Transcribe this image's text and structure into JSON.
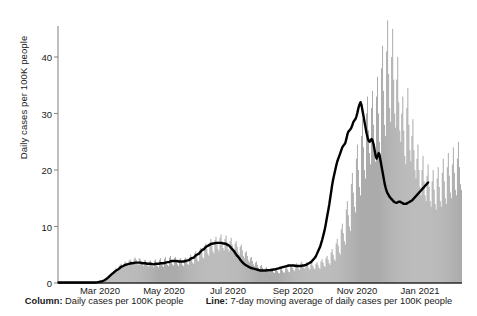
{
  "chart_data": {
    "type": "bar",
    "title": "",
    "subtitle": "",
    "xlabel": "",
    "ylabel": "Daily cases per 100K people",
    "ylim": [
      0,
      48
    ],
    "yticks": [
      0,
      10,
      20,
      30,
      40
    ],
    "ytick_labels": [
      "0",
      "10",
      "20",
      "30",
      "40"
    ],
    "xtick_labels": [
      "Mar 2020",
      "May 2020",
      "Jul 2020",
      "Sep 2020",
      "Nov 2020",
      "Jan 2021"
    ],
    "xtick_positions": [
      100,
      164,
      228,
      293,
      357,
      420
    ],
    "grid": false,
    "legend_position": "below",
    "series": [
      {
        "name": "Column: Daily cases per 100K people",
        "type": "bar",
        "color": "#9a9a9a",
        "values": [
          0.1,
          0.1,
          0.1,
          0.1,
          0.1,
          0.1,
          0.1,
          0.1,
          0.1,
          0.1,
          0.1,
          0.1,
          0.1,
          0.1,
          0.1,
          0.1,
          0.1,
          0.1,
          0.1,
          0.1,
          0.1,
          0.1,
          0.1,
          0.1,
          0.1,
          0.1,
          0.1,
          0.1,
          0.1,
          0.1,
          0.1,
          0.1,
          0.1,
          0.1,
          0.1,
          0.1,
          0.1,
          0.1,
          0.1,
          0.2,
          0.2,
          0.2,
          0.3,
          0.3,
          0.4,
          0.5,
          0.6,
          0.8,
          0.9,
          1.0,
          1.2,
          1.4,
          1.5,
          1.7,
          1.8,
          2.0,
          2.2,
          2.6,
          2.3,
          2.1,
          2.9,
          3.2,
          3.4,
          3.0,
          2.7,
          3.4,
          3.8,
          3.6,
          3.2,
          3.0,
          4.0,
          4.2,
          3.9,
          3.3,
          3.1,
          4.3,
          4.5,
          4.1,
          3.4,
          3.2,
          4.4,
          4.2,
          3.8,
          3.3,
          3.0,
          4.0,
          4.1,
          3.6,
          3.1,
          2.9,
          3.8,
          4.0,
          3.5,
          3.0,
          2.8,
          3.9,
          4.2,
          3.4,
          3.0,
          2.8,
          4.1,
          4.4,
          3.6,
          3.1,
          2.9,
          4.3,
          4.6,
          3.8,
          3.2,
          3.0,
          4.5,
          4.8,
          4.0,
          3.3,
          3.1,
          4.4,
          4.6,
          3.9,
          3.3,
          3.0,
          4.2,
          4.4,
          3.8,
          3.2,
          3.0,
          4.3,
          4.5,
          3.9,
          3.4,
          3.2,
          4.6,
          5.0,
          4.2,
          3.6,
          3.4,
          5.2,
          5.6,
          4.8,
          4.0,
          3.8,
          5.8,
          6.2,
          5.4,
          4.6,
          4.3,
          6.6,
          7.0,
          6.0,
          5.2,
          4.8,
          7.2,
          7.8,
          6.6,
          5.6,
          5.2,
          7.6,
          8.2,
          7.0,
          6.0,
          5.6,
          8.0,
          8.6,
          7.4,
          6.2,
          5.8,
          7.8,
          8.4,
          7.2,
          6.0,
          5.6,
          7.4,
          8.0,
          6.8,
          5.8,
          5.4,
          7.0,
          7.4,
          6.4,
          5.4,
          5.0,
          6.4,
          6.8,
          5.8,
          4.8,
          4.4,
          5.4,
          5.6,
          4.8,
          4.0,
          3.7,
          4.4,
          4.6,
          3.9,
          3.3,
          3.0,
          3.6,
          3.8,
          3.2,
          2.7,
          2.5,
          3.0,
          3.2,
          2.7,
          2.3,
          2.1,
          2.6,
          2.8,
          2.4,
          2.0,
          1.9,
          2.4,
          2.6,
          2.2,
          1.9,
          1.8,
          2.3,
          2.5,
          2.1,
          1.8,
          1.7,
          2.4,
          2.6,
          2.2,
          1.9,
          1.8,
          2.6,
          2.8,
          2.4,
          2.0,
          1.9,
          2.9,
          3.2,
          2.7,
          2.3,
          2.1,
          3.2,
          3.5,
          3.0,
          2.5,
          2.3,
          3.5,
          3.8,
          3.2,
          2.7,
          2.5,
          3.4,
          3.7,
          3.1,
          2.6,
          2.4,
          3.3,
          3.6,
          3.0,
          2.6,
          2.4,
          3.4,
          3.7,
          3.2,
          2.7,
          2.5,
          3.8,
          4.2,
          3.6,
          3.0,
          2.8,
          4.4,
          4.8,
          4.1,
          3.5,
          3.2,
          5.4,
          6.0,
          5.0,
          4.2,
          3.9,
          7.0,
          7.8,
          6.6,
          5.4,
          5.0,
          9.5,
          10.5,
          8.8,
          7.4,
          6.8,
          13.0,
          14.5,
          12.0,
          10.0,
          9.2,
          17.5,
          19.5,
          16.0,
          13.5,
          12.5,
          22.0,
          24.5,
          20.0,
          17.0,
          15.5,
          26.0,
          29.0,
          24.0,
          20.0,
          18.5,
          30.0,
          33.0,
          27.0,
          23.0,
          21.0,
          31.0,
          34.0,
          28.0,
          23.5,
          21.5,
          33.0,
          36.5,
          30.0,
          25.0,
          23.0,
          38.0,
          42.0,
          34.0,
          28.0,
          26.0,
          41.0,
          46.5,
          37.0,
          31.0,
          28.5,
          40.0,
          45.0,
          36.0,
          30.0,
          27.5,
          36.0,
          40.0,
          32.0,
          27.0,
          25.0,
          30.0,
          33.0,
          27.0,
          22.5,
          21.0,
          31.0,
          34.5,
          28.0,
          23.5,
          21.5,
          26.0,
          29.0,
          23.5,
          20.0,
          18.5,
          22.0,
          24.5,
          20.0,
          17.0,
          15.5,
          20.0,
          22.5,
          18.0,
          15.5,
          14.5,
          19.0,
          21.0,
          17.0,
          14.5,
          13.5,
          18.0,
          20.0,
          16.5,
          14.0,
          13.0,
          18.5,
          20.5,
          17.0,
          14.5,
          13.5,
          19.5,
          22.0,
          18.0,
          15.0,
          14.0,
          20.5,
          23.0,
          19.0,
          16.0,
          15.0,
          21.0,
          24.0,
          19.5,
          16.5,
          15.5,
          22.0,
          25.0,
          20.5,
          17.5,
          16.5
        ]
      },
      {
        "name": "Line: 7-day moving average of daily cases per 100K people",
        "type": "line",
        "color": "#000000",
        "values": [
          0.1,
          0.1,
          0.1,
          0.1,
          0.1,
          0.1,
          0.1,
          0.1,
          0.1,
          0.1,
          0.1,
          0.1,
          0.1,
          0.1,
          0.1,
          0.1,
          0.1,
          0.1,
          0.1,
          0.1,
          0.1,
          0.1,
          0.1,
          0.1,
          0.1,
          0.1,
          0.1,
          0.1,
          0.1,
          0.1,
          0.1,
          0.1,
          0.1,
          0.1,
          0.1,
          0.1,
          0.1,
          0.1,
          0.12,
          0.15,
          0.18,
          0.22,
          0.26,
          0.3,
          0.36,
          0.45,
          0.55,
          0.68,
          0.8,
          0.95,
          1.1,
          1.3,
          1.45,
          1.6,
          1.75,
          1.9,
          2.05,
          2.2,
          2.3,
          2.4,
          2.55,
          2.7,
          2.85,
          2.95,
          3.0,
          3.1,
          3.2,
          3.25,
          3.3,
          3.35,
          3.4,
          3.45,
          3.5,
          3.5,
          3.5,
          3.55,
          3.6,
          3.6,
          3.6,
          3.6,
          3.6,
          3.6,
          3.55,
          3.5,
          3.5,
          3.5,
          3.5,
          3.45,
          3.4,
          3.4,
          3.4,
          3.4,
          3.4,
          3.35,
          3.3,
          3.35,
          3.4,
          3.4,
          3.4,
          3.4,
          3.45,
          3.5,
          3.5,
          3.5,
          3.5,
          3.55,
          3.6,
          3.65,
          3.7,
          3.7,
          3.75,
          3.85,
          3.9,
          3.9,
          3.9,
          3.9,
          3.9,
          3.9,
          3.85,
          3.8,
          3.8,
          3.8,
          3.8,
          3.8,
          3.8,
          3.85,
          3.9,
          3.95,
          4.0,
          4.05,
          4.15,
          4.3,
          4.4,
          4.45,
          4.5,
          4.7,
          4.9,
          5.0,
          5.1,
          5.2,
          5.4,
          5.6,
          5.8,
          5.9,
          6.0,
          6.2,
          6.4,
          6.5,
          6.6,
          6.7,
          6.8,
          6.9,
          6.95,
          7.0,
          7.0,
          7.05,
          7.1,
          7.1,
          7.1,
          7.1,
          7.1,
          7.1,
          7.05,
          7.0,
          7.0,
          6.95,
          6.9,
          6.8,
          6.7,
          6.6,
          6.4,
          6.2,
          6.0,
          5.8,
          5.6,
          5.3,
          5.0,
          4.8,
          4.6,
          4.4,
          4.1,
          3.9,
          3.7,
          3.5,
          3.35,
          3.2,
          3.1,
          3.0,
          2.9,
          2.8,
          2.7,
          2.65,
          2.6,
          2.55,
          2.5,
          2.45,
          2.4,
          2.35,
          2.3,
          2.25,
          2.2,
          2.2,
          2.2,
          2.2,
          2.2,
          2.2,
          2.25,
          2.25,
          2.25,
          2.25,
          2.3,
          2.3,
          2.35,
          2.4,
          2.4,
          2.45,
          2.5,
          2.55,
          2.6,
          2.65,
          2.7,
          2.75,
          2.8,
          2.85,
          2.9,
          2.95,
          3.0,
          3.05,
          3.1,
          3.1,
          3.1,
          3.1,
          3.1,
          3.1,
          3.05,
          3.05,
          3.0,
          3.0,
          3.0,
          3.0,
          3.0,
          3.05,
          3.1,
          3.1,
          3.15,
          3.2,
          3.3,
          3.4,
          3.5,
          3.6,
          3.7,
          3.9,
          4.1,
          4.3,
          4.5,
          4.8,
          5.2,
          5.6,
          6.0,
          6.4,
          7.0,
          7.6,
          8.3,
          9.0,
          9.8,
          10.8,
          11.8,
          12.8,
          13.8,
          15.0,
          16.2,
          17.4,
          18.4,
          19.2,
          20.0,
          20.8,
          21.5,
          22.0,
          22.5,
          23.0,
          23.5,
          24.0,
          24.3,
          24.5,
          24.8,
          25.5,
          26.3,
          26.8,
          27.0,
          27.2,
          27.5,
          28.0,
          28.5,
          28.8,
          29.0,
          29.5,
          30.2,
          31.0,
          31.6,
          32.0,
          31.5,
          30.5,
          29.5,
          28.5,
          27.5,
          26.5,
          25.8,
          25.2,
          25.0,
          25.2,
          25.5,
          25.2,
          24.5,
          23.5,
          22.5,
          22.0,
          22.5,
          23.0,
          22.5,
          21.5,
          20.5,
          19.5,
          18.5,
          17.5,
          16.8,
          16.2,
          15.8,
          15.5,
          15.2,
          15.0,
          14.8,
          14.6,
          14.4,
          14.3,
          14.2,
          14.2,
          14.3,
          14.4,
          14.4,
          14.3,
          14.2,
          14.1,
          14.0,
          14.0,
          14.0,
          14.1,
          14.2,
          14.3,
          14.4,
          14.5,
          14.6,
          14.8,
          15.0,
          15.2,
          15.4,
          15.6,
          15.8,
          16.0,
          16.2,
          16.4,
          16.6,
          16.8,
          17.0,
          17.2,
          17.4,
          17.6,
          17.8
        ]
      }
    ]
  },
  "legend": {
    "column_key": "Column:",
    "column_text": "Daily cases per 100K people",
    "line_key": "Line:",
    "line_text": "7-day moving average of daily cases per 100K people"
  }
}
